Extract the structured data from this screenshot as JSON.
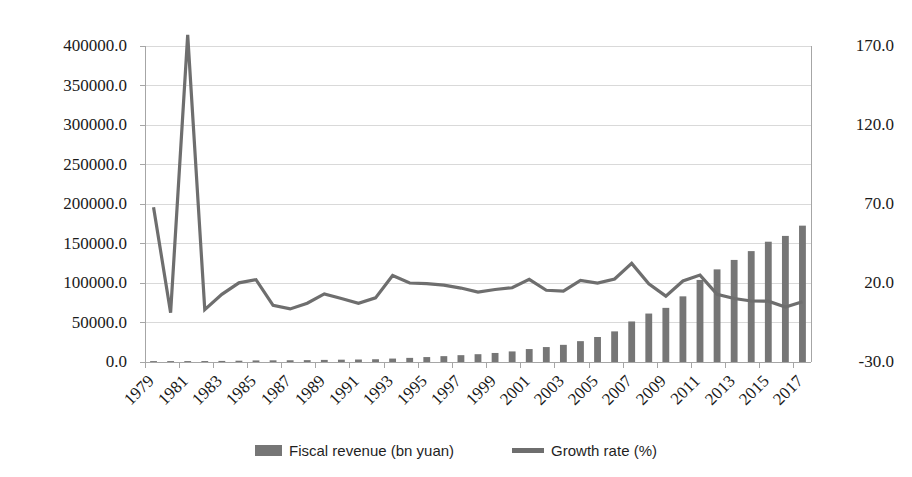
{
  "chart_data": {
    "type": "bar",
    "title": "",
    "subtitle": "",
    "xlabel": "",
    "ylabel": "",
    "y2label": "",
    "grid": true,
    "legend_position": "bottom",
    "x": [
      1979,
      1980,
      1981,
      1982,
      1983,
      1984,
      1985,
      1986,
      1987,
      1988,
      1989,
      1990,
      1991,
      1992,
      1993,
      1994,
      1995,
      1996,
      1997,
      1998,
      1999,
      2000,
      2001,
      2002,
      2003,
      2004,
      2005,
      2006,
      2007,
      2008,
      2009,
      2010,
      2011,
      2012,
      2013,
      2014,
      2015,
      2016,
      2017
    ],
    "xtick_labels": [
      "1979",
      "1981",
      "1983",
      "1985",
      "1987",
      "1989",
      "1991",
      "1993",
      "1995",
      "1997",
      "1999",
      "2001",
      "2003",
      "2005",
      "2007",
      "2009",
      "2011",
      "2013",
      "2015",
      "2017"
    ],
    "ytick_labels_left": [
      "0.0",
      "50000.0",
      "100000.0",
      "150000.0",
      "200000.0",
      "250000.0",
      "300000.0",
      "350000.0",
      "400000.0"
    ],
    "ytick_labels_right": [
      "-30.0",
      "20.0",
      "70.0",
      "120.0",
      "170.0"
    ],
    "ylim": [
      0,
      400000
    ],
    "y2lim": [
      -30,
      170
    ],
    "series": [
      {
        "name": "Fiscal revenue (bn yuan)",
        "type": "bar",
        "axis": "left",
        "color": "#767676",
        "values": [
          1146,
          1160,
          1176,
          1212,
          1367,
          1643,
          2005,
          2122,
          2199,
          2357,
          2665,
          2937,
          3149,
          3483,
          4349,
          5218,
          6242,
          7408,
          8651,
          9876,
          11444,
          13395,
          16386,
          18904,
          21715,
          26396,
          31649,
          38760,
          51322,
          61330,
          68518,
          83102,
          103874,
          117254,
          129210,
          140370,
          152269,
          159605,
          172593
        ]
      },
      {
        "name": "Growth rate (%)",
        "type": "line",
        "axis": "right",
        "color": "#6e6e6e",
        "values": [
          68.0,
          1.2,
          177.0,
          3.1,
          12.8,
          20.1,
          22.1,
          5.8,
          3.6,
          7.2,
          13.1,
          10.2,
          7.2,
          10.6,
          24.8,
          20.0,
          19.6,
          18.7,
          16.8,
          14.2,
          15.9,
          17.0,
          22.3,
          15.4,
          14.9,
          21.6,
          19.9,
          22.5,
          32.4,
          19.5,
          11.7,
          21.3,
          25.0,
          12.9,
          10.2,
          8.6,
          8.5,
          4.8,
          8.1
        ]
      }
    ]
  },
  "legend": {
    "items": [
      {
        "label": "Fiscal revenue (bn yuan)",
        "marker": "bar-swatch",
        "color": "#767676"
      },
      {
        "label": "Growth rate (%)",
        "marker": "line-swatch",
        "color": "#6e6e6e"
      }
    ]
  },
  "colors": {
    "background": "#ffffff",
    "bar": "#767676",
    "line": "#6e6e6e",
    "gridline": "#d9d9d9",
    "axis": "#a6a6a6",
    "text": "#1a1a1a"
  }
}
